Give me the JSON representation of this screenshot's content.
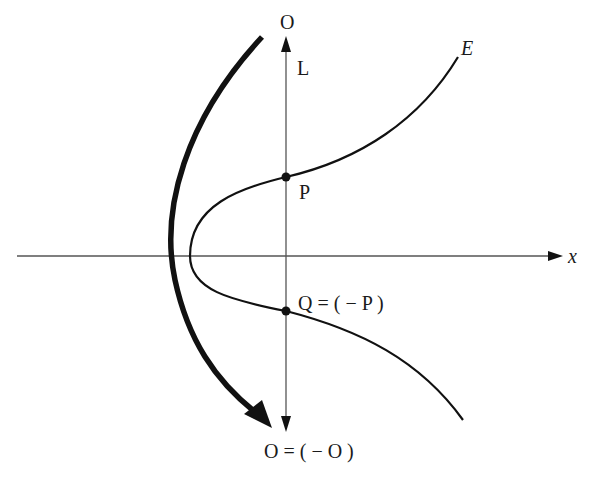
{
  "diagram": {
    "colors": {
      "stroke": "#111111",
      "axis": "#555555",
      "background": "#ffffff"
    },
    "labels": {
      "top_O": "O",
      "line_L": "L",
      "curve_E": "E",
      "point_P": "P",
      "point_Q": "Q = ( − P )",
      "bottom_O": "O = ( − O )",
      "x_axis": "x"
    },
    "points": [
      {
        "name": "P",
        "x": 286,
        "y": 177
      },
      {
        "name": "Q",
        "x": 286,
        "y": 311
      }
    ],
    "axes": {
      "x_axis": {
        "y": 256,
        "x_start": 17,
        "x_end": 562
      },
      "vertical_line_L": {
        "x": 286,
        "y_top": 38,
        "y_bottom": 430
      }
    }
  }
}
